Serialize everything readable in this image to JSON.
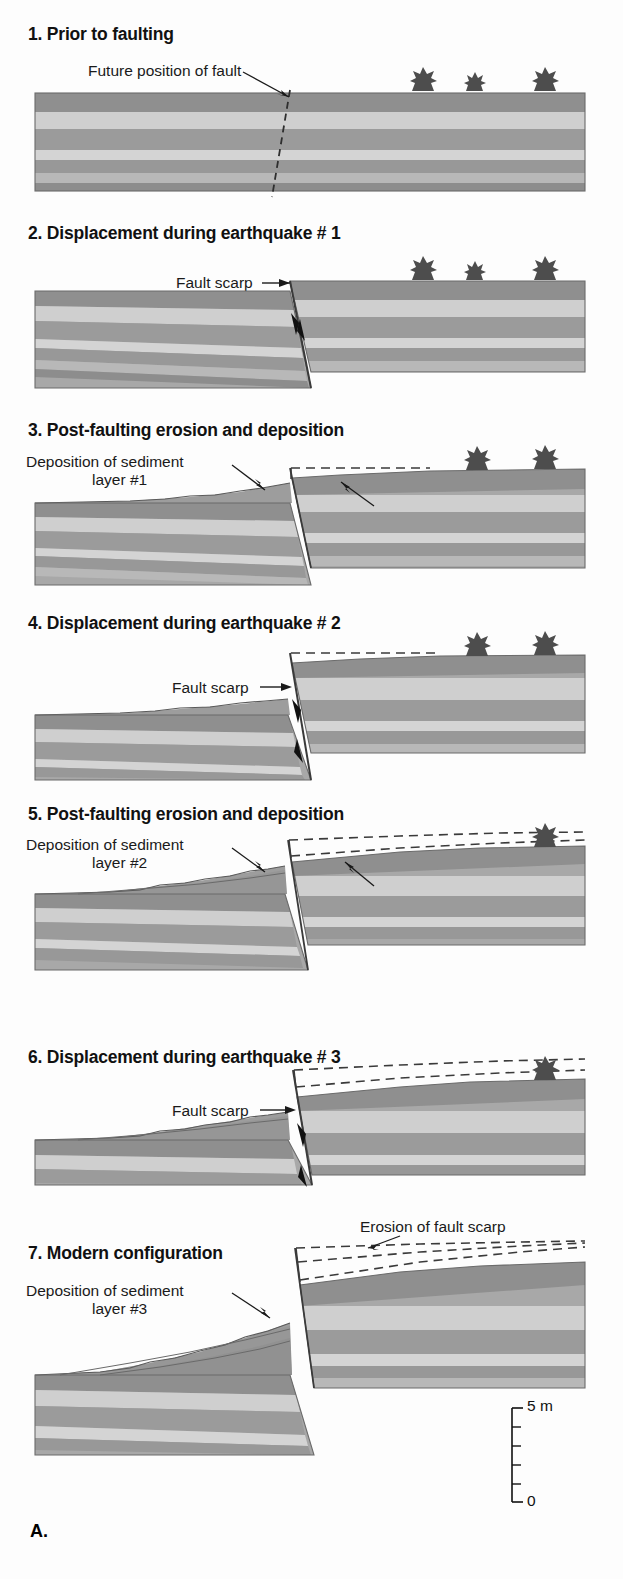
{
  "figure": {
    "label": "A.",
    "domain": "geology-cross-section-sequence"
  },
  "colors": {
    "layer_dark": "#8f8f8f",
    "layer_mid": "#a8a8a8",
    "layer_light": "#cacaca",
    "layer_pale": "#d8d8d8",
    "sediment": "#9a9a9a",
    "sediment_light": "#bdbdbd",
    "outline": "#4a4a4a",
    "dashed": "#3a3a3a",
    "shrub": "#4d4d4d",
    "text": "#111111",
    "background": "#ffffff"
  },
  "panels": [
    {
      "number": "1.",
      "title": "1. Prior to faulting",
      "annotations": [
        {
          "name": "future-fault-label",
          "text": "Future position of fault"
        }
      ],
      "shrubs": 3,
      "has_fault_dashed": true,
      "has_scarp": false,
      "sediment_wedges": 0,
      "erosion_dashes": 0
    },
    {
      "number": "2.",
      "title": "2. Displacement during earthquake # 1",
      "annotations": [
        {
          "name": "fault-scarp-label",
          "text": "Fault scarp"
        }
      ],
      "shrubs": 3,
      "has_fault_dashed": false,
      "has_scarp": true,
      "sediment_wedges": 0,
      "erosion_dashes": 0,
      "motion_arrows": 2
    },
    {
      "number": "3.",
      "title": "3. Post-faulting erosion and deposition",
      "annotations": [
        {
          "name": "deposition-label",
          "text": "Deposition of sediment"
        },
        {
          "name": "deposition-layer-label",
          "text": "layer #1"
        },
        {
          "name": "erosion-label",
          "text": "Erosion of fault scarp"
        }
      ],
      "shrubs": 2,
      "has_fault_dashed": false,
      "has_scarp": true,
      "sediment_wedges": 1,
      "erosion_dashes": 1
    },
    {
      "number": "4.",
      "title": "4. Displacement during earthquake # 2",
      "annotations": [
        {
          "name": "fault-scarp-label",
          "text": "Fault scarp"
        }
      ],
      "shrubs": 2,
      "has_fault_dashed": false,
      "has_scarp": true,
      "sediment_wedges": 1,
      "erosion_dashes": 1,
      "motion_arrows": 2
    },
    {
      "number": "5.",
      "title": "5. Post-faulting erosion and deposition",
      "annotations": [
        {
          "name": "deposition-label",
          "text": "Deposition of sediment"
        },
        {
          "name": "deposition-layer-label",
          "text": "layer #2"
        },
        {
          "name": "erosion-label",
          "text": "Erosion of fault scarp"
        }
      ],
      "shrubs": 1,
      "has_fault_dashed": false,
      "has_scarp": true,
      "sediment_wedges": 2,
      "erosion_dashes": 2
    },
    {
      "number": "6.",
      "title": "6. Displacement during earthquake # 3",
      "annotations": [
        {
          "name": "fault-scarp-label",
          "text": "Fault scarp"
        }
      ],
      "shrubs": 1,
      "has_fault_dashed": false,
      "has_scarp": true,
      "sediment_wedges": 2,
      "erosion_dashes": 2,
      "motion_arrows": 2
    },
    {
      "number": "7.",
      "title": "7. Modern configuration",
      "annotations": [
        {
          "name": "deposition-label",
          "text": "Deposition of sediment"
        },
        {
          "name": "deposition-layer-label",
          "text": "layer #3"
        },
        {
          "name": "erosion-label",
          "text": "Erosion of fault scarp"
        }
      ],
      "shrubs": 0,
      "has_fault_dashed": false,
      "has_scarp": true,
      "sediment_wedges": 3,
      "erosion_dashes": 3
    }
  ],
  "scale_bar": {
    "name": "vertical-scale-bar",
    "top_label": "5 m",
    "bottom_label": "0",
    "major_ticks": 6,
    "units": "m",
    "range": [
      0,
      5
    ]
  }
}
